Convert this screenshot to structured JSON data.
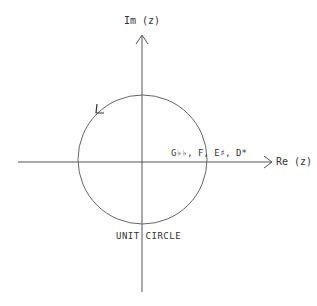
{
  "diagram": {
    "axes": {
      "imaginary_label": "Im (z)",
      "real_label": "Re (z)"
    },
    "circle": {
      "caption": "UNIT CIRCLE",
      "direction": "counterclockwise"
    },
    "point_label": "G♭♭, F, E♯, D*",
    "colors": {
      "line": "#555555",
      "text": "#333333",
      "background": "#ffffff"
    }
  }
}
